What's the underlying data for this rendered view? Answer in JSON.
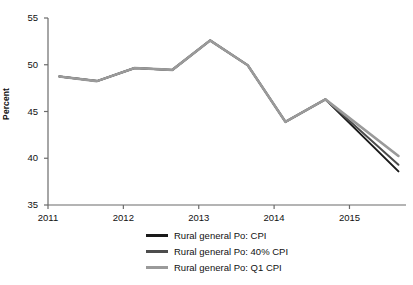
{
  "chart_data": {
    "type": "line",
    "title": "",
    "xlabel": "",
    "ylabel": "Percent",
    "ylim": [
      35,
      55
    ],
    "xlim": [
      2011,
      2015.75
    ],
    "yticks": [
      35,
      40,
      45,
      50,
      55
    ],
    "xticks": [
      "2011",
      "2012",
      "2013",
      "2014",
      "2015"
    ],
    "grid": false,
    "legend_position": "bottom-center",
    "x": [
      2011.15,
      2011.65,
      2012.15,
      2012.65,
      2013.15,
      2013.65,
      2014.15,
      2014.68,
      2015.65
    ],
    "series": [
      {
        "name": "Rural general Po: CPI",
        "color": "#1a1a1a",
        "values": [
          48.75,
          48.25,
          49.65,
          49.45,
          52.6,
          49.95,
          43.9,
          46.3,
          38.6
        ]
      },
      {
        "name": "Rural general Po: 40% CPI",
        "color": "#4d4d4d",
        "values": [
          48.75,
          48.25,
          49.65,
          49.45,
          52.6,
          49.95,
          43.9,
          46.3,
          39.3
        ]
      },
      {
        "name": "Rural general Po: Q1 CPI",
        "color": "#9a9a9a",
        "values": [
          48.75,
          48.25,
          49.65,
          49.45,
          52.6,
          49.95,
          43.9,
          46.3,
          40.25
        ]
      }
    ]
  },
  "axes": {
    "y_label": "Percent",
    "y_tick_labels": [
      "55",
      "50",
      "45",
      "40",
      "35"
    ],
    "x_tick_labels": [
      "2011",
      "2012",
      "2013",
      "2014",
      "2015"
    ]
  },
  "legend": {
    "items": [
      {
        "label": "Rural general Po: CPI",
        "color": "#1a1a1a"
      },
      {
        "label": "Rural general Po: 40% CPI",
        "color": "#4d4d4d"
      },
      {
        "label": "Rural general Po: Q1 CPI",
        "color": "#9a9a9a"
      }
    ]
  },
  "colors": {
    "axis": "#6b6b6b",
    "text": "#111111",
    "background": "#ffffff"
  }
}
